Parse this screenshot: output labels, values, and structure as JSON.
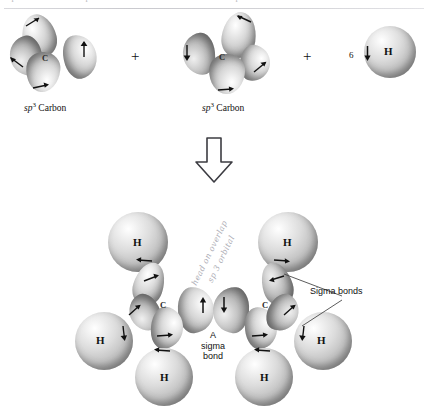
{
  "figure": {
    "title_remnants": [
      "sp",
      "sp",
      "sp"
    ],
    "reaction_operator": "+",
    "reaction_arrow": "down-block-arrow"
  },
  "reactants": [
    {
      "id": "sp3-carbon-left",
      "center_label": "C",
      "caption_prefix": "sp",
      "caption_sup": "3",
      "caption_suffix": " Carbon",
      "lobes": 4,
      "spin_arrows": [
        "up-right",
        "up",
        "up-left",
        "right"
      ]
    },
    {
      "id": "sp3-carbon-right",
      "center_label": "C",
      "caption_prefix": "sp",
      "caption_sup": "3",
      "caption_suffix": " Carbon",
      "lobes": 4,
      "spin_arrows": [
        "left",
        "down",
        "up-right",
        "right"
      ]
    },
    {
      "id": "hydrogen-atoms",
      "count": "6",
      "atom_label": "H",
      "spin_arrow": "down"
    }
  ],
  "product": {
    "carbon_labels": [
      "C",
      "C"
    ],
    "hydrogen_labels": [
      "H",
      "H",
      "H",
      "H",
      "H",
      "H"
    ],
    "center_bond_label": [
      "A",
      "sigma",
      "bond"
    ],
    "sigma_bonds_label": "Sigma bonds",
    "center_spin_arrows": [
      "up",
      "down"
    ]
  },
  "annotations": {
    "handwritten_line1": "head on overlap",
    "handwritten_line2": "sp 3 orbital"
  },
  "colors": {
    "background": "#ffffff",
    "ink": "#111111",
    "sphere_light": "#f2f2f2",
    "sphere_shadow": "#777777",
    "pencil": "#a9a9b2"
  }
}
